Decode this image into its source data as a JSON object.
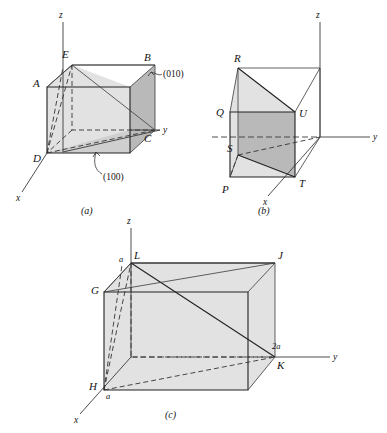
{
  "figure": {
    "background_color": "#ffffff",
    "line_color": "#3a3a3a",
    "shade_light": "#e2e2e2",
    "shade_mid": "#cfcfcf",
    "shade_dark": "#b9b9b9"
  },
  "panels": [
    {
      "id": "a",
      "caption": "(a)",
      "axes": {
        "x": "x",
        "y": "y",
        "z": "z"
      },
      "vertices": [
        "A",
        "B",
        "C",
        "D",
        "E"
      ],
      "vertex_labels": {
        "A": "A",
        "B": "B",
        "C": "C",
        "D": "D",
        "E": "E"
      },
      "plane_labels": [
        {
          "text": "(010)",
          "points_to": "right-face"
        },
        {
          "text": "(100)",
          "points_to": "bottom-triangle"
        }
      ]
    },
    {
      "id": "b",
      "caption": "(b)",
      "axes": {
        "x": "x",
        "y": "y",
        "z": "z"
      },
      "vertices": [
        "P",
        "Q",
        "R",
        "S",
        "T",
        "U"
      ],
      "vertex_labels": {
        "P": "P",
        "Q": "Q",
        "R": "R",
        "S": "S",
        "T": "T",
        "U": "U"
      },
      "plane_labels": []
    },
    {
      "id": "c",
      "caption": "(c)",
      "axes": {
        "x": "x",
        "y": "y",
        "z": "z"
      },
      "vertices": [
        "G",
        "H",
        "J",
        "K",
        "L"
      ],
      "vertex_labels": {
        "G": "G",
        "H": "H",
        "J": "J",
        "K": "K",
        "L": "L"
      },
      "dimension_labels": [
        {
          "text": "a",
          "at": "L-top"
        },
        {
          "text": "a",
          "at": "H-bottom"
        },
        {
          "text": "2a",
          "at": "K-right"
        }
      ],
      "plane_labels": []
    }
  ]
}
